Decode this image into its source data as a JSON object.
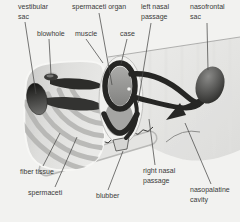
{
  "labels": {
    "vestibular_sac": "vestibular\nsac",
    "blowhole": "blowhole",
    "muscle": "muscle",
    "spermaceti_organ": "spermaceti organ",
    "case": "case",
    "left_nasal_passage": "left nasal\npassage",
    "nasofrontal_sac": "nasofrontal\nsac",
    "fiber_tissue": "fiber tissue",
    "spermaceti": "spermaceti",
    "blubber": "blubber",
    "right_nasal_passage": "right nasal\npassage",
    "nasopalatine_cavity": "nasopalatine\ncavity"
  },
  "colors": {
    "background": "#f2f2f0",
    "label_text": "#3a3a3a",
    "leader_line": "#4a4a48",
    "dark_structure": "#262624",
    "body_light": "#e7e7e5",
    "body_mid": "#cfcfcd",
    "fiber_band": "#b2b2b0"
  }
}
